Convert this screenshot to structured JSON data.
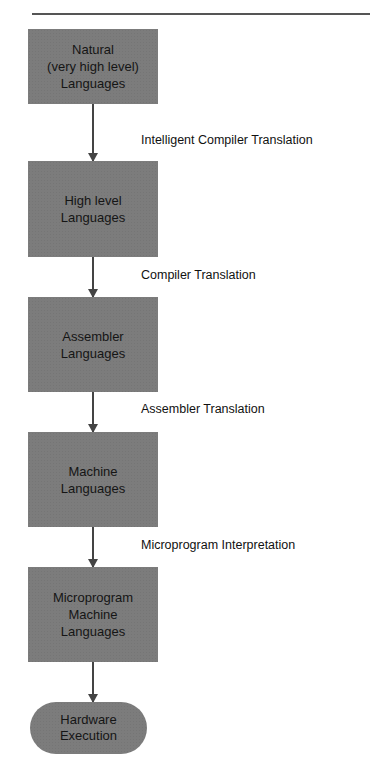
{
  "header": {
    "title_fragment": "gure  .   .  .  y  .  .  g  g  g"
  },
  "diagram": {
    "nodes": [
      {
        "id": "natural",
        "label": "Natural\n(very high level)\nLanguages",
        "shape": "rect"
      },
      {
        "id": "high-level",
        "label": "High level\nLanguages",
        "shape": "rect"
      },
      {
        "id": "assembler",
        "label": "Assembler\nLanguages",
        "shape": "rect"
      },
      {
        "id": "machine",
        "label": "Machine\nLanguages",
        "shape": "rect"
      },
      {
        "id": "microprogram",
        "label": "Microprogram\nMachine\nLanguages",
        "shape": "rect"
      },
      {
        "id": "hardware",
        "label": "Hardware\nExecution",
        "shape": "terminal"
      }
    ],
    "edges": [
      {
        "from": "natural",
        "to": "high-level",
        "label": "Intelligent Compiler Translation"
      },
      {
        "from": "high-level",
        "to": "assembler",
        "label": "Compiler Translation"
      },
      {
        "from": "assembler",
        "to": "machine",
        "label": "Assembler Translation"
      },
      {
        "from": "machine",
        "to": "microprogram",
        "label": "Microprogram Interpretation"
      },
      {
        "from": "microprogram",
        "to": "hardware",
        "label": ""
      }
    ]
  },
  "colors": {
    "box_fill": "#7c7c7c",
    "arrow": "#444444",
    "text": "#111111"
  }
}
